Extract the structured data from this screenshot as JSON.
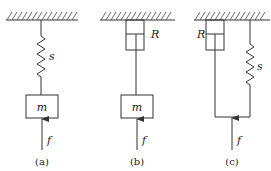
{
  "diagrams": [
    {
      "id": "a",
      "caption": "(a)",
      "components": [
        "spring",
        "mass"
      ],
      "labels": {
        "spring": "s",
        "mass": "m",
        "force": "f"
      }
    },
    {
      "id": "b",
      "caption": "(b)",
      "components": [
        "damper",
        "mass"
      ],
      "labels": {
        "damper": "R",
        "mass": "m",
        "force": "f"
      }
    },
    {
      "id": "c",
      "caption": "(c)",
      "components": [
        "damper",
        "spring",
        "connecting-bar"
      ],
      "labels": {
        "damper": "R",
        "spring": "s",
        "force": "f"
      }
    }
  ],
  "colors": {
    "line": "#333333",
    "background": "#ffffff"
  }
}
